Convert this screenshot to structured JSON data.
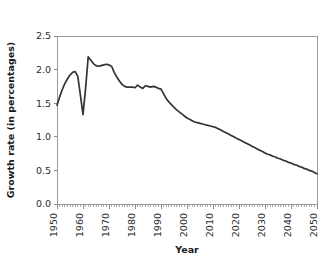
{
  "chart_data": {
    "type": "line",
    "title": "",
    "xlabel": "Year",
    "ylabel": "Growth rate (in percentages)",
    "xlim": [
      1950,
      2050
    ],
    "ylim": [
      0.0,
      2.5
    ],
    "grid": false,
    "legend": "none",
    "x_tick_labels": [
      "1950",
      "1960",
      "1970",
      "1980",
      "1990",
      "2000",
      "2010",
      "2020",
      "2030",
      "2040",
      "2050"
    ],
    "x_ticks": [
      1950,
      1960,
      1970,
      1980,
      1990,
      2000,
      2010,
      2020,
      2030,
      2040,
      2050
    ],
    "x_minor_tick_step": 1,
    "y_tick_labels": [
      "0.0",
      "0.5",
      "1.0",
      "1.5",
      "2.0",
      "2.5"
    ],
    "y_ticks": [
      0.0,
      0.5,
      1.0,
      1.5,
      2.0,
      2.5
    ],
    "line_color": "#333333",
    "axis_color": "#9a9a9a",
    "background_color": "#ffffff",
    "x": [
      1950,
      1951,
      1952,
      1953,
      1954,
      1955,
      1956,
      1957,
      1958,
      1959,
      1960,
      1961,
      1962,
      1963,
      1964,
      1965,
      1966,
      1967,
      1968,
      1969,
      1970,
      1971,
      1972,
      1973,
      1974,
      1975,
      1976,
      1977,
      1978,
      1979,
      1980,
      1981,
      1982,
      1983,
      1984,
      1985,
      1986,
      1987,
      1988,
      1989,
      1990,
      1991,
      1992,
      1993,
      1994,
      1995,
      1996,
      1997,
      1998,
      1999,
      2000,
      2001,
      2002,
      2003,
      2004,
      2005,
      2006,
      2007,
      2008,
      2009,
      2010,
      2011,
      2012,
      2013,
      2014,
      2015,
      2016,
      2017,
      2018,
      2019,
      2020,
      2021,
      2022,
      2023,
      2024,
      2025,
      2026,
      2027,
      2028,
      2029,
      2030,
      2031,
      2032,
      2033,
      2034,
      2035,
      2036,
      2037,
      2038,
      2039,
      2040,
      2041,
      2042,
      2043,
      2044,
      2045,
      2046,
      2047,
      2048,
      2049,
      2050
    ],
    "values": [
      1.47,
      1.59,
      1.7,
      1.79,
      1.86,
      1.92,
      1.96,
      1.97,
      1.9,
      1.62,
      1.33,
      1.72,
      2.19,
      2.14,
      2.09,
      2.06,
      2.05,
      2.06,
      2.07,
      2.08,
      2.07,
      2.05,
      1.96,
      1.89,
      1.83,
      1.78,
      1.75,
      1.74,
      1.74,
      1.74,
      1.73,
      1.77,
      1.74,
      1.72,
      1.76,
      1.75,
      1.74,
      1.75,
      1.74,
      1.72,
      1.71,
      1.64,
      1.57,
      1.52,
      1.48,
      1.44,
      1.4,
      1.37,
      1.34,
      1.31,
      1.28,
      1.26,
      1.24,
      1.22,
      1.21,
      1.2,
      1.19,
      1.18,
      1.17,
      1.16,
      1.15,
      1.14,
      1.12,
      1.1,
      1.08,
      1.06,
      1.04,
      1.02,
      1.0,
      0.98,
      0.96,
      0.94,
      0.92,
      0.9,
      0.88,
      0.86,
      0.84,
      0.82,
      0.8,
      0.78,
      0.76,
      0.74,
      0.73,
      0.71,
      0.7,
      0.68,
      0.67,
      0.65,
      0.64,
      0.62,
      0.61,
      0.59,
      0.58,
      0.56,
      0.55,
      0.53,
      0.52,
      0.5,
      0.49,
      0.47,
      0.45
    ]
  }
}
